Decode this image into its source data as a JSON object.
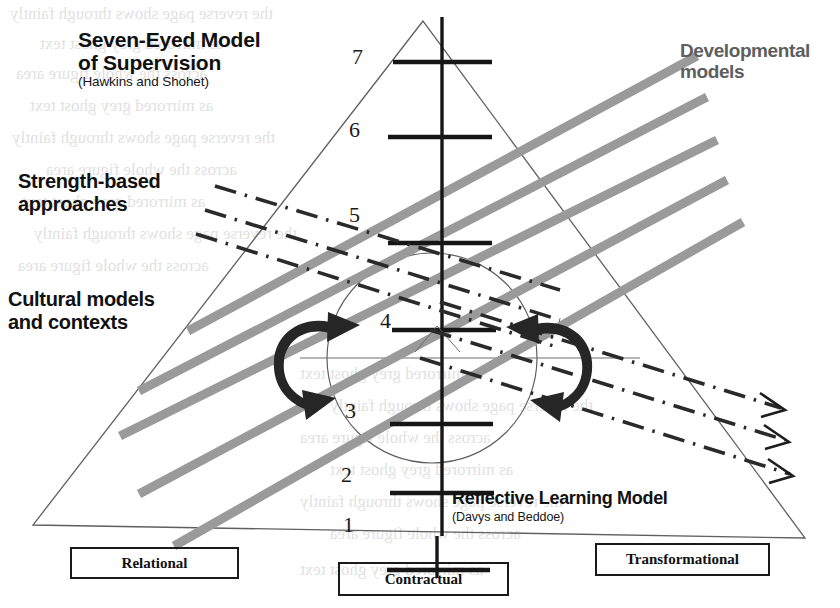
{
  "figure": {
    "title_line1": "Seven-Eyed Model",
    "title_line2": "of Supervision",
    "title_source": "(Hawkins and Shohet)",
    "developmental_line1": "Developmental",
    "developmental_line2": "models",
    "strength_line1": "Strength-based",
    "strength_line2": "approaches",
    "cultural_line1": "Cultural models",
    "cultural_line2": "and contexts",
    "reflective_title": "Reflective Learning Model",
    "reflective_source": "(Davys and Beddoe)"
  },
  "ladder": {
    "numbers": [
      "7",
      "6",
      "5",
      "4",
      "3",
      "2",
      "1"
    ]
  },
  "base_boxes": [
    {
      "label": "Relational"
    },
    {
      "label": "Contractual"
    },
    {
      "label": "Transformational"
    }
  ],
  "colors": {
    "band_grey": "#9a9a9a",
    "ink": "#1a1a1a",
    "dev_text": "#5e5e5e",
    "hairline": "#6a6a6a"
  },
  "bleed_through_text": [
    "the reverse page shows through faintly",
    "as mirrored grey ghost text",
    "across the whole figure area"
  ]
}
